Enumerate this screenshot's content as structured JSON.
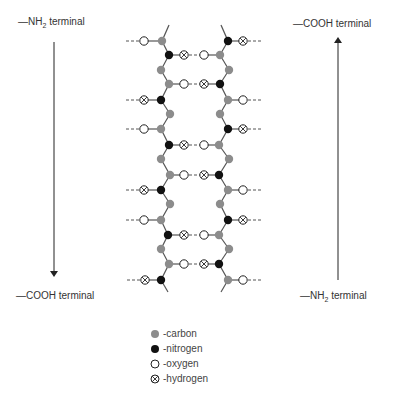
{
  "labels": {
    "top_left": {
      "prefix": "—NH",
      "sub": "2",
      "suffix": " terminal"
    },
    "bottom_left": {
      "text": "—COOH  terminal"
    },
    "top_right": {
      "text": "—COOH  terminal"
    },
    "bottom_right": {
      "prefix": "—NH",
      "sub": "2",
      "suffix": " terminal"
    }
  },
  "arrows": {
    "left": {
      "x": 54,
      "y1": 42,
      "y2": 274,
      "direction": "down"
    },
    "right": {
      "x": 338,
      "y1": 280,
      "y2": 40,
      "direction": "up"
    }
  },
  "colors": {
    "carbon": "#8c8c8c",
    "nitrogen": "#111111",
    "oxygen": "#ffffff",
    "hydrogen": "#ffffff",
    "bond": "#555555",
    "hbond": "#555555"
  },
  "structure": {
    "description": "Antiparallel beta-pleated sheet: two polypeptide strands linked by hydrogen bonds",
    "left_strand": [
      {
        "y": 41,
        "backbone": "C",
        "x": 162,
        "side": {
          "atom": "O",
          "x": 144,
          "outer": true
        }
      },
      {
        "y": 55,
        "backbone": "N",
        "x": 169,
        "side": {
          "atom": "H",
          "x": 184,
          "hbond_to": "O"
        }
      },
      {
        "y": 70,
        "backbone": "C",
        "x": 161
      },
      {
        "y": 84,
        "backbone": "C",
        "x": 169,
        "side": {
          "atom": "O",
          "x": 184,
          "hbond_to": "H"
        }
      },
      {
        "y": 100,
        "backbone": "N",
        "x": 161,
        "side": {
          "atom": "H",
          "x": 144,
          "outer": true
        }
      },
      {
        "y": 114,
        "backbone": "C",
        "x": 170
      },
      {
        "y": 129,
        "backbone": "C",
        "x": 161,
        "side": {
          "atom": "O",
          "x": 144,
          "outer": true
        }
      },
      {
        "y": 145,
        "backbone": "N",
        "x": 169,
        "side": {
          "atom": "H",
          "x": 184,
          "hbond_to": "O"
        }
      },
      {
        "y": 159,
        "backbone": "C",
        "x": 161
      },
      {
        "y": 175,
        "backbone": "C",
        "x": 170,
        "side": {
          "atom": "O",
          "x": 184,
          "hbond_to": "H"
        }
      },
      {
        "y": 190,
        "backbone": "N",
        "x": 161,
        "side": {
          "atom": "H",
          "x": 144,
          "outer": true
        }
      },
      {
        "y": 204,
        "backbone": "C",
        "x": 170
      },
      {
        "y": 220,
        "backbone": "C",
        "x": 161,
        "side": {
          "atom": "O",
          "x": 144,
          "outer": true
        }
      },
      {
        "y": 235,
        "backbone": "N",
        "x": 168,
        "side": {
          "atom": "H",
          "x": 184,
          "hbond_to": "O"
        }
      },
      {
        "y": 249,
        "backbone": "C",
        "x": 161
      },
      {
        "y": 264,
        "backbone": "C",
        "x": 169,
        "side": {
          "atom": "O",
          "x": 184,
          "hbond_to": "H"
        }
      },
      {
        "y": 280,
        "backbone": "N",
        "x": 161,
        "side": {
          "atom": "H",
          "x": 145,
          "outer": true
        }
      }
    ],
    "right_strand": [
      {
        "y": 41,
        "backbone": "N",
        "x": 228,
        "side": {
          "atom": "H",
          "x": 243,
          "outer": true
        }
      },
      {
        "y": 55,
        "backbone": "C",
        "x": 220,
        "side": {
          "atom": "O",
          "x": 204
        }
      },
      {
        "y": 70,
        "backbone": "C",
        "x": 229
      },
      {
        "y": 84,
        "backbone": "N",
        "x": 220,
        "side": {
          "atom": "H",
          "x": 204
        }
      },
      {
        "y": 100,
        "backbone": "C",
        "x": 228,
        "side": {
          "atom": "O",
          "x": 243,
          "outer": true
        }
      },
      {
        "y": 114,
        "backbone": "C",
        "x": 220
      },
      {
        "y": 129,
        "backbone": "N",
        "x": 228,
        "side": {
          "atom": "H",
          "x": 243,
          "outer": true
        }
      },
      {
        "y": 145,
        "backbone": "C",
        "x": 219,
        "side": {
          "atom": "O",
          "x": 204
        }
      },
      {
        "y": 159,
        "backbone": "C",
        "x": 229
      },
      {
        "y": 175,
        "backbone": "N",
        "x": 219,
        "side": {
          "atom": "H",
          "x": 204
        }
      },
      {
        "y": 190,
        "backbone": "C",
        "x": 228,
        "side": {
          "atom": "O",
          "x": 243,
          "outer": true
        }
      },
      {
        "y": 204,
        "backbone": "C",
        "x": 220
      },
      {
        "y": 220,
        "backbone": "N",
        "x": 228,
        "side": {
          "atom": "H",
          "x": 243,
          "outer": true
        }
      },
      {
        "y": 235,
        "backbone": "C",
        "x": 219,
        "side": {
          "atom": "O",
          "x": 204
        }
      },
      {
        "y": 249,
        "backbone": "C",
        "x": 229
      },
      {
        "y": 264,
        "backbone": "N",
        "x": 219,
        "side": {
          "atom": "H",
          "x": 204
        }
      },
      {
        "y": 280,
        "backbone": "C",
        "x": 228,
        "side": {
          "atom": "O",
          "x": 243,
          "outer": true
        }
      }
    ],
    "stubs": {
      "left_top": {
        "x1": 162,
        "y1": 41,
        "x2": 169,
        "y2": 25
      },
      "right_top": {
        "x1": 228,
        "y1": 41,
        "x2": 221,
        "y2": 25
      },
      "left_bottom": {
        "x1": 161,
        "y1": 280,
        "x2": 168,
        "y2": 292
      },
      "right_bottom": {
        "x1": 228,
        "y1": 280,
        "x2": 221,
        "y2": 292
      }
    }
  },
  "legend": {
    "items": [
      {
        "symbol": "carbon",
        "label": "-carbon"
      },
      {
        "symbol": "nitrogen",
        "label": "-nitrogen"
      },
      {
        "symbol": "oxygen",
        "label": "-oxygen"
      },
      {
        "symbol": "hydrogen",
        "label": "-hydrogen"
      }
    ]
  }
}
